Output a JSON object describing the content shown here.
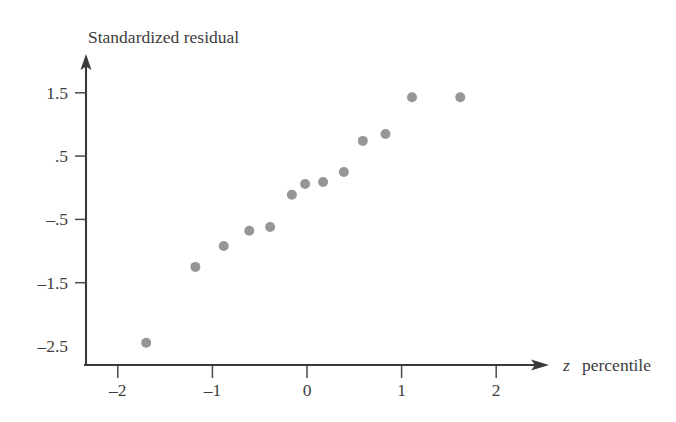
{
  "chart_data": {
    "type": "scatter",
    "title": "",
    "subtitle": "",
    "xlabel": "z  percentile",
    "xlabel_variable": "z",
    "xlabel_rest": "percentile",
    "ylabel": "Standardized residual",
    "xlim": [
      -2.35,
      2.45
    ],
    "ylim": [
      -2.5,
      1.9
    ],
    "xticks": [
      -2,
      -1,
      0,
      1,
      2
    ],
    "xtick_labels": [
      "–2",
      "–1",
      "0",
      "1",
      "2"
    ],
    "yticks": [
      1.5,
      0.5,
      -0.5,
      -1.5,
      -2.5
    ],
    "ytick_labels": [
      "1.5",
      ".5",
      "–.5",
      "–1.5",
      "–2.5"
    ],
    "grid": false,
    "legend": "none",
    "marker": {
      "shape": "circle",
      "color": "#969696",
      "radius": 5.0
    },
    "axis_color": "#3a3a3a",
    "series": [
      {
        "name": "residuals",
        "points": [
          [
            -1.7,
            -2.45
          ],
          [
            -1.18,
            -1.25
          ],
          [
            -0.88,
            -0.92
          ],
          [
            -0.61,
            -0.68
          ],
          [
            -0.39,
            -0.62
          ],
          [
            -0.16,
            -0.11
          ],
          [
            -0.02,
            0.06
          ],
          [
            0.17,
            0.09
          ],
          [
            0.39,
            0.25
          ],
          [
            0.59,
            0.74
          ],
          [
            0.83,
            0.85
          ],
          [
            1.11,
            1.43
          ],
          [
            1.62,
            1.43
          ]
        ]
      }
    ]
  },
  "figure": {
    "background": "#ffffff",
    "text_color": "#3d3d3d"
  }
}
